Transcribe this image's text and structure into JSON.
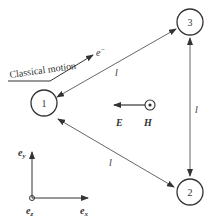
{
  "diagram": {
    "nodes": [
      {
        "id": "1",
        "label": "1",
        "cx": 44,
        "cy": 103
      },
      {
        "id": "2",
        "label": "2",
        "cx": 190,
        "cy": 192
      },
      {
        "id": "3",
        "label": "3",
        "cx": 190,
        "cy": 22
      }
    ],
    "edges": [
      {
        "from": "1",
        "to": "3",
        "label": "l",
        "bidirectional": true
      },
      {
        "from": "1",
        "to": "2",
        "label": "l",
        "bidirectional": true
      },
      {
        "from": "3",
        "to": "2",
        "label": "l",
        "bidirectional": true
      }
    ],
    "classical_motion": {
      "label": "Classical motion",
      "particle": "e",
      "particle_sup": "−"
    },
    "fields": {
      "E": "E",
      "H": "H"
    },
    "axes": {
      "x": "e",
      "x_sub": "x",
      "y": "e",
      "y_sub": "y",
      "z": "e",
      "z_sub": "z"
    },
    "colors": {
      "stroke": "#333333",
      "background": "#ffffff"
    }
  }
}
